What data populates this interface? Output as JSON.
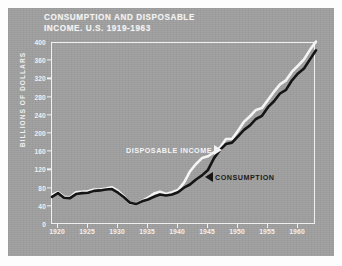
{
  "figure": {
    "plate_color": "#9d9d9d",
    "ink_light": "#f0f0f0",
    "ink_dark": "#151515"
  },
  "chart_data": {
    "type": "line",
    "title": "CONSUMPTION AND DISPOSABLE INCOME. U.S. 1919-1963",
    "title_line1": "CONSUMPTION AND DISPOSABLE",
    "title_line2": "INCOME. U.S. 1919-1963",
    "xlabel": "",
    "ylabel": "BILLIONS OF DOLLARS",
    "xlim": [
      1919,
      1963
    ],
    "ylim": [
      0,
      400
    ],
    "grid": false,
    "legend_position": "inline-annotations",
    "yticks": [
      0,
      40,
      80,
      120,
      160,
      200,
      240,
      280,
      320,
      360,
      400
    ],
    "ytick_labels": [
      "0",
      "40",
      "80",
      "120",
      "160",
      "200",
      "240",
      "280",
      "320",
      "360",
      "400"
    ],
    "xticks": [
      1920,
      1925,
      1930,
      1935,
      1940,
      1945,
      1950,
      1955,
      1960
    ],
    "xtick_labels": [
      "1920",
      "1925",
      "1930",
      "1935",
      "1940",
      "1945",
      "1950",
      "1955",
      "1960"
    ],
    "x": [
      1919,
      1920,
      1921,
      1922,
      1923,
      1924,
      1925,
      1926,
      1927,
      1928,
      1929,
      1930,
      1931,
      1932,
      1933,
      1934,
      1935,
      1936,
      1937,
      1938,
      1939,
      1940,
      1941,
      1942,
      1943,
      1944,
      1945,
      1946,
      1947,
      1948,
      1949,
      1950,
      1951,
      1952,
      1953,
      1954,
      1955,
      1956,
      1957,
      1958,
      1959,
      1960,
      1961,
      1962,
      1963
    ],
    "series": [
      {
        "name": "DISPOSABLE INCOME",
        "color": "#f4f4f4",
        "values": [
          66,
          72,
          62,
          61,
          72,
          73,
          74,
          78,
          78,
          80,
          83,
          75,
          63,
          48,
          46,
          53,
          60,
          69,
          73,
          68,
          72,
          77,
          93,
          118,
          134,
          147,
          151,
          160,
          170,
          189,
          189,
          207,
          227,
          239,
          253,
          257,
          275,
          293,
          309,
          318,
          337,
          350,
          364,
          385,
          403
        ]
      },
      {
        "name": "CONSUMPTION",
        "color": "#151515",
        "values": [
          62,
          70,
          60,
          59,
          68,
          70,
          71,
          75,
          76,
          78,
          79,
          71,
          61,
          49,
          46,
          52,
          56,
          62,
          67,
          65,
          67,
          72,
          82,
          89,
          100,
          109,
          121,
          147,
          165,
          178,
          181,
          195,
          209,
          219,
          233,
          240,
          259,
          272,
          289,
          297,
          318,
          333,
          344,
          364,
          384
        ]
      }
    ],
    "annotations": [
      {
        "text": "DISPOSABLE INCOME",
        "marker": "triangle-right",
        "color": "#f4f4f4"
      },
      {
        "text": "CONSUMPTION",
        "marker": "triangle-left",
        "color": "#151515"
      }
    ]
  }
}
